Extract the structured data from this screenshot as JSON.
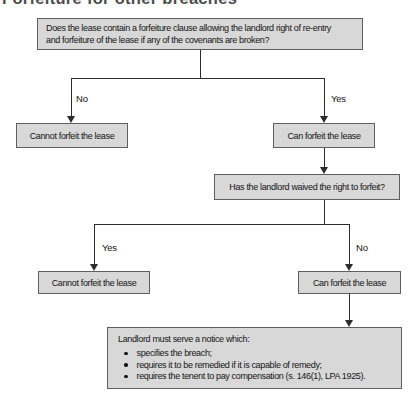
{
  "page": {
    "heading": "Forfeiture for other breaches"
  },
  "colors": {
    "background": "#ffffff",
    "box_fill": "#d8d8d8",
    "box_border": "#5f5f5f",
    "connector": "#2d2d2d",
    "text": "#141414",
    "heading_text": "#4d4d4d"
  },
  "flowchart": {
    "q1_line1": "Does the lease contain a forfeiture clause allowing the landlord right of re-entry",
    "q1_line2": "and forfeiture of the lease if any of the covenants are broken?",
    "branch1_no": "No",
    "branch1_yes": "Yes",
    "outcome1_no": "Cannot forfeit the lease",
    "outcome1_yes": "Can forfeit the lease",
    "q2": "Has the landlord waived the right to forfeit?",
    "branch2_yes": "Yes",
    "branch2_no": "No",
    "outcome2_yes": "Cannot forfeit the lease",
    "outcome2_no": "Can forfeit the lease",
    "notice_intro": "Landlord must serve a notice which:",
    "notice_bullets": [
      "specifies the breach;",
      "requires it to be remedied if it is capable of remedy;",
      "requires the tenent to pay compensation (s. 146(1), LPA 1925)."
    ]
  }
}
